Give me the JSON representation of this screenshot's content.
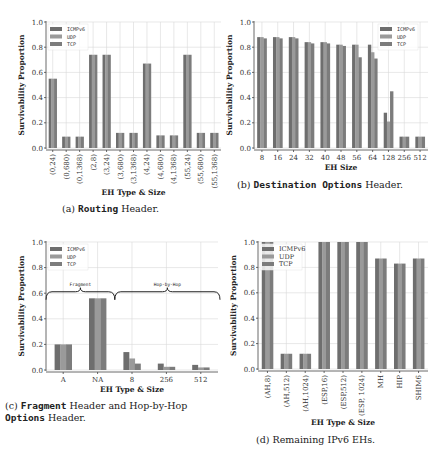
{
  "colors": {
    "icmpv6": "#6e6e6e",
    "udp": "#9a9a9a",
    "tcp": "#7c7c7c"
  },
  "chart_data": [
    {
      "id": "a",
      "type": "bar",
      "title": "",
      "caption_prefix": "(a) ",
      "caption_mono": "Routing",
      "caption_suffix": " Header.",
      "xlabel": "EH Type & Size",
      "ylabel": "Survivability Proportion",
      "ylim": [
        0,
        1.0
      ],
      "yticks": [
        "0.0",
        "0.2",
        "0.4",
        "0.6",
        "0.8",
        "1.0"
      ],
      "grid": true,
      "legend_position": "top-left",
      "legend": [
        "ICMPv6",
        "UDP",
        "TCP"
      ],
      "categories": [
        "(0,24)",
        "(0,680)",
        "(0,1368)",
        "(2,8)",
        "(3,24)",
        "(3,680)",
        "(3,1368)",
        "(4,24)",
        "(4,680)",
        "(4,1368)",
        "(55,24)",
        "(55,680)",
        "(55,1368)"
      ],
      "series": [
        {
          "name": "ICMPv6",
          "values": [
            0.55,
            0.09,
            0.09,
            0.74,
            0.74,
            0.12,
            0.12,
            0.67,
            0.1,
            0.1,
            0.74,
            0.12,
            0.12
          ]
        },
        {
          "name": "UDP",
          "values": [
            0.55,
            0.09,
            0.09,
            0.74,
            0.74,
            0.12,
            0.12,
            0.67,
            0.1,
            0.1,
            0.74,
            0.12,
            0.12
          ]
        },
        {
          "name": "TCP",
          "values": [
            0.55,
            0.09,
            0.09,
            0.74,
            0.74,
            0.12,
            0.12,
            0.67,
            0.1,
            0.1,
            0.74,
            0.12,
            0.12
          ]
        }
      ]
    },
    {
      "id": "b",
      "type": "bar",
      "title": "",
      "caption_prefix": "(b) ",
      "caption_mono": "Destination Options",
      "caption_suffix": " Header.",
      "xlabel": "EH Size",
      "ylabel": "Survivability Proportion",
      "ylim": [
        0,
        1.0
      ],
      "yticks": [
        "0.0",
        "0.2",
        "0.4",
        "0.6",
        "0.8",
        "1.0"
      ],
      "grid": true,
      "legend_position": "top-right",
      "legend": [
        "ICMPv6",
        "UDP",
        "TCP"
      ],
      "categories": [
        "8",
        "16",
        "24",
        "32",
        "40",
        "48",
        "56",
        "64",
        "128",
        "256",
        "512"
      ],
      "series": [
        {
          "name": "ICMPv6",
          "values": [
            0.88,
            0.88,
            0.88,
            0.84,
            0.84,
            0.82,
            0.82,
            0.82,
            0.28,
            0.09,
            0.09
          ]
        },
        {
          "name": "UDP",
          "values": [
            0.88,
            0.88,
            0.88,
            0.84,
            0.84,
            0.82,
            0.82,
            0.76,
            0.21,
            0.09,
            0.09
          ]
        },
        {
          "name": "TCP",
          "values": [
            0.87,
            0.87,
            0.87,
            0.83,
            0.83,
            0.81,
            0.72,
            0.71,
            0.45,
            0.09,
            0.09
          ]
        }
      ]
    },
    {
      "id": "c",
      "type": "bar",
      "title": "",
      "caption_prefix": "(c) ",
      "caption_mono": "Fragment",
      "caption_suffix": " Header and Hop-by-Hop",
      "caption_line2_mono": "Options",
      "caption_line2_suffix": " Header.",
      "xlabel": "EH Type & Size",
      "ylabel": "Survivability Proportion",
      "ylim": [
        0,
        1.0
      ],
      "yticks": [
        "0.0",
        "0.2",
        "0.4",
        "0.6",
        "0.8",
        "1.0"
      ],
      "grid": true,
      "legend_position": "top-left",
      "legend": [
        "ICMPv6",
        "UDP",
        "TCP"
      ],
      "annotations": [
        "Fragment",
        "Hop-by-Hop"
      ],
      "categories": [
        "A",
        "NA",
        "8",
        "256",
        "512"
      ],
      "series": [
        {
          "name": "ICMPv6",
          "values": [
            0.2,
            0.56,
            0.14,
            0.05,
            0.04
          ]
        },
        {
          "name": "UDP",
          "values": [
            0.2,
            0.56,
            0.09,
            0.025,
            0.02
          ]
        },
        {
          "name": "TCP",
          "values": [
            0.2,
            0.56,
            0.05,
            0.025,
            0.02
          ]
        }
      ]
    },
    {
      "id": "d",
      "type": "bar",
      "title": "",
      "caption_prefix": "(d) ",
      "caption_mono": "",
      "caption_suffix": "Remaining IPv6 EHs.",
      "xlabel": "EH Type & Size",
      "ylabel": "Survivability Proportion",
      "ylim": [
        0,
        1.0
      ],
      "yticks": [
        "0.0",
        "0.2",
        "0.4",
        "0.6",
        "0.8",
        "1.0"
      ],
      "grid": true,
      "legend_position": "top-left",
      "legend": [
        "ICMPv6",
        "UDP",
        "TCP"
      ],
      "categories": [
        "(AH,8)",
        "(AH,512)",
        "(AH,1024)",
        "(ESP,16)",
        "(ESP,512)",
        "(ESP, 1024)",
        "MH",
        "HIP",
        "SHIM6"
      ],
      "series": [
        {
          "name": "ICMPv6",
          "values": [
            1.0,
            0.12,
            0.12,
            1.0,
            1.0,
            1.0,
            0.87,
            0.83,
            0.87
          ]
        },
        {
          "name": "UDP",
          "values": [
            1.0,
            0.12,
            0.12,
            1.0,
            1.0,
            1.0,
            0.87,
            0.83,
            0.87
          ]
        },
        {
          "name": "TCP",
          "values": [
            1.0,
            0.12,
            0.12,
            1.0,
            1.0,
            1.0,
            0.87,
            0.83,
            0.87
          ]
        }
      ]
    }
  ]
}
